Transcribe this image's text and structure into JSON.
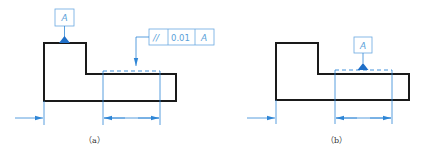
{
  "figure": {
    "panels": [
      {
        "id": "a",
        "caption": "（a）",
        "datum_label": "A",
        "tolerance_frame": {
          "symbol": "//",
          "value": "0.01",
          "datum": "A"
        }
      },
      {
        "id": "b",
        "caption": "（b）",
        "datum_label": "A"
      }
    ]
  },
  "colors": {
    "outline": "#1a1a1a",
    "annotation_blue": "#2f86d6",
    "datum_triangle": "#1f6fc8",
    "frame_border": "#6aa9e0"
  }
}
